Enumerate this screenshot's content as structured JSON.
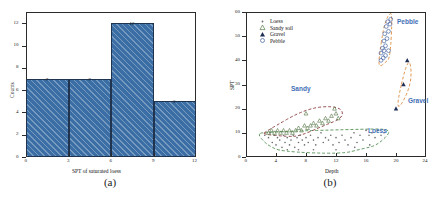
{
  "figure": {
    "panel_a_caption": "(a)",
    "panel_b_caption": "(b)"
  },
  "chart_data": [
    {
      "type": "bar",
      "panel": "(a)",
      "title": "",
      "xlabel": "SPT of saturated loess",
      "ylabel": "Counts",
      "categories": [
        "0-3",
        "3-6",
        "6-9",
        "9-12"
      ],
      "bin_edges": [
        0,
        3,
        6,
        9,
        12
      ],
      "values": [
        7,
        7,
        12,
        5
      ],
      "data_labels": [
        "7",
        "7",
        "12",
        "5"
      ],
      "xticks": [
        "0",
        "3",
        "6",
        "9",
        "12"
      ],
      "yticks": [
        "0",
        "2",
        "4",
        "6",
        "8",
        "10",
        "12"
      ],
      "xlim": [
        0,
        12
      ],
      "ylim": [
        0,
        13
      ],
      "grid": false,
      "bar_fill": "#3b6ea5",
      "bar_edge": "#20344f",
      "hatch": "diagonal"
    },
    {
      "type": "scatter",
      "panel": "(b)",
      "title": "",
      "xlabel": "Depth",
      "ylabel": "SPT",
      "xticks": [
        "0",
        "4",
        "8",
        "12",
        "16",
        "20",
        "24"
      ],
      "yticks": [
        "0",
        "10",
        "20",
        "30",
        "40",
        "50",
        "60"
      ],
      "xlim": [
        0,
        24
      ],
      "ylim": [
        0,
        60
      ],
      "grid": false,
      "legend": {
        "position": "upper-left",
        "entries": [
          {
            "label": "Loess",
            "marker": "dot",
            "color": "#6b6b6b"
          },
          {
            "label": "Sandy soil",
            "marker": "open-triangle",
            "color": "#5a7a4a"
          },
          {
            "label": "Gravel",
            "marker": "filled-triangle",
            "color": "#1f2f55"
          },
          {
            "label": "Pebble",
            "marker": "open-circle",
            "color": "#3f5f9f"
          }
        ]
      },
      "annotations": [
        {
          "text": "Pebble",
          "x": 21.0,
          "y": 52.0,
          "color": "#3f6fb5"
        },
        {
          "text": "Gravel",
          "x": 22.0,
          "y": 19.0,
          "color": "#3f6fb5"
        },
        {
          "text": "Sandy",
          "x": 8.0,
          "y": 25.0,
          "color": "#3f6fb5"
        },
        {
          "text": "Loess",
          "x": 18.5,
          "y": 5.0,
          "color": "#3f6fb5"
        }
      ],
      "clusters": [
        {
          "name": "Sandy",
          "outline_color": "#8b3a3a",
          "style": "dashed"
        },
        {
          "name": "Loess",
          "outline_color": "#4f8f4f",
          "style": "dashed"
        },
        {
          "name": "Pebble",
          "outline_color": "#d98a3d",
          "style": "dashed"
        },
        {
          "name": "Gravel",
          "outline_color": "#d98a3d",
          "style": "dashed"
        }
      ],
      "series": [
        {
          "name": "Loess",
          "marker": "dot",
          "color": "#6b6b6b",
          "points": [
            [
              2.5,
              9
            ],
            [
              3.0,
              8
            ],
            [
              3.2,
              10
            ],
            [
              3.5,
              6
            ],
            [
              3.8,
              9
            ],
            [
              4.0,
              5
            ],
            [
              4.2,
              8
            ],
            [
              4.5,
              7
            ],
            [
              4.8,
              4
            ],
            [
              5.0,
              9
            ],
            [
              5.2,
              6
            ],
            [
              5.5,
              8
            ],
            [
              5.8,
              5
            ],
            [
              6.0,
              7
            ],
            [
              6.3,
              9
            ],
            [
              6.5,
              4
            ],
            [
              6.8,
              8
            ],
            [
              7.0,
              6
            ],
            [
              7.2,
              9
            ],
            [
              7.5,
              7
            ],
            [
              7.8,
              5
            ],
            [
              8.0,
              8
            ],
            [
              8.3,
              6
            ],
            [
              8.6,
              9
            ],
            [
              9.0,
              7
            ],
            [
              9.3,
              5
            ],
            [
              9.6,
              8
            ],
            [
              10.0,
              10
            ],
            [
              10.3,
              6
            ],
            [
              10.6,
              8
            ],
            [
              11.0,
              7
            ],
            [
              11.3,
              9
            ],
            [
              11.6,
              5
            ],
            [
              12.0,
              8
            ],
            [
              12.4,
              6
            ],
            [
              12.8,
              9
            ],
            [
              13.2,
              7
            ],
            [
              13.6,
              5
            ],
            [
              14.0,
              8
            ],
            [
              14.4,
              10
            ],
            [
              14.8,
              6
            ],
            [
              15.2,
              9
            ],
            [
              15.6,
              7
            ],
            [
              16.0,
              11
            ],
            [
              16.4,
              9
            ],
            [
              16.8,
              10
            ],
            [
              17.2,
              8
            ],
            [
              17.6,
              11
            ],
            [
              18.0,
              9
            ],
            [
              18.4,
              10
            ],
            [
              5.5,
              3
            ],
            [
              7.0,
              3
            ],
            [
              9.0,
              3
            ],
            [
              12.0,
              3
            ],
            [
              14.5,
              4
            ],
            [
              16.5,
              5
            ]
          ]
        },
        {
          "name": "Sandy soil",
          "marker": "open-triangle",
          "color": "#5a7a4a",
          "points": [
            [
              3.0,
              10
            ],
            [
              3.4,
              11
            ],
            [
              3.8,
              10
            ],
            [
              4.2,
              11
            ],
            [
              4.6,
              10
            ],
            [
              5.0,
              11
            ],
            [
              5.4,
              10
            ],
            [
              5.8,
              11
            ],
            [
              6.2,
              10
            ],
            [
              6.6,
              11
            ],
            [
              7.0,
              12
            ],
            [
              7.4,
              11
            ],
            [
              7.8,
              13
            ],
            [
              8.0,
              18
            ],
            [
              8.2,
              12
            ],
            [
              8.6,
              13
            ],
            [
              9.0,
              14
            ],
            [
              9.4,
              13
            ],
            [
              9.8,
              15
            ],
            [
              10.2,
              14
            ],
            [
              10.6,
              16
            ],
            [
              11.0,
              15
            ],
            [
              11.4,
              17
            ],
            [
              11.8,
              20
            ],
            [
              12.0,
              18
            ],
            [
              12.3,
              16
            ]
          ]
        },
        {
          "name": "Gravel",
          "marker": "filled-triangle",
          "color": "#1f2f55",
          "points": [
            [
              20.0,
              20
            ],
            [
              21.0,
              30
            ],
            [
              21.5,
              40
            ]
          ]
        },
        {
          "name": "Pebble",
          "marker": "open-circle",
          "color": "#3f5f9f",
          "points": [
            [
              18.0,
              40
            ],
            [
              18.3,
              41
            ],
            [
              18.0,
              43
            ],
            [
              18.4,
              44
            ],
            [
              18.2,
              45
            ],
            [
              18.6,
              46
            ],
            [
              18.4,
              48
            ],
            [
              18.8,
              49
            ],
            [
              18.5,
              51
            ],
            [
              19.0,
              52
            ],
            [
              18.7,
              54
            ],
            [
              19.2,
              55
            ],
            [
              18.9,
              56
            ],
            [
              19.3,
              57
            ],
            [
              19.0,
              44
            ],
            [
              18.6,
              42
            ]
          ]
        }
      ]
    }
  ]
}
